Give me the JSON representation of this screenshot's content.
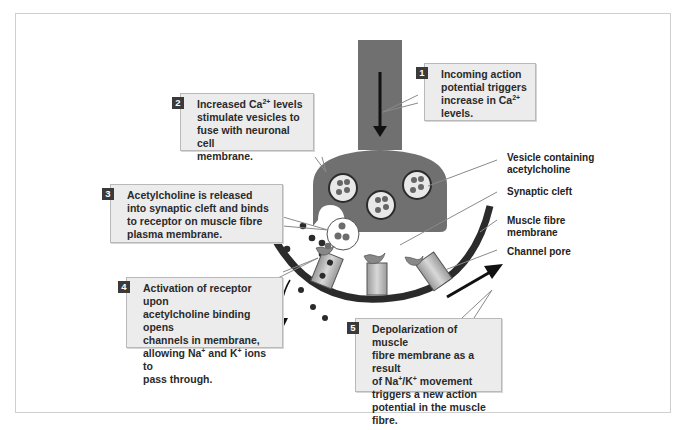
{
  "diagram": {
    "callouts": [
      {
        "num": "1",
        "line1": "Incoming action",
        "line2": "potential triggers",
        "line3a": "increase in Ca",
        "line3sup": "2+",
        "line4": "levels."
      },
      {
        "num": "2",
        "line1a": "Increased Ca",
        "line1sup": "2+",
        "line1b": " levels",
        "line2": "stimulate vesicles to",
        "line3": "fuse with neuronal cell",
        "line4": "membrane."
      },
      {
        "num": "3",
        "line1": "Acetylcholine is released",
        "line2": "into synaptic cleft and binds",
        "line3": "to receptor on muscle fibre",
        "line4": "plasma membrane."
      },
      {
        "num": "4",
        "line1": "Activation of receptor upon",
        "line2": "acetylcholine binding opens",
        "line3": "channels in membrane,",
        "line4a": "allowing Na",
        "line4sup1": "+",
        "line4b": " and K",
        "line4sup2": "+",
        "line4c": " ions to",
        "line5": "pass through."
      },
      {
        "num": "5",
        "line1": "Depolarization of muscle",
        "line2": "fibre membrane as a result",
        "line3a": "of Na",
        "line3sup1": "+",
        "line3b": "/K",
        "line3sup2": "+",
        "line3c": " movement",
        "line4": "triggers a new action",
        "line5": "potential in the muscle fibre."
      }
    ],
    "labels": {
      "vesicle_line1": "Vesicle containing",
      "vesicle_line2": "acetylcholine",
      "synaptic_cleft": "Synaptic cleft",
      "muscle_line1": "Muscle fibre",
      "muscle_line2": "membrane",
      "channel_pore": "Channel pore"
    },
    "colors": {
      "neuron": "#707070",
      "membrane": "#2b2b2b",
      "callout_bg": "#ececec",
      "badge": "#3a3a3a"
    }
  }
}
